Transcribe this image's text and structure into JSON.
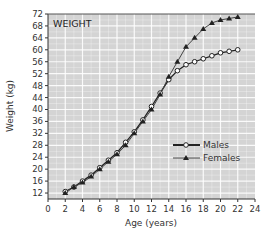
{
  "chart_data": {
    "type": "line",
    "title": "WEIGHT",
    "xlabel": "Age (years)",
    "ylabel": "Weight (kg)",
    "xlim": [
      0,
      24
    ],
    "ylim": [
      10,
      72
    ],
    "xticks": [
      0,
      2,
      4,
      6,
      8,
      10,
      12,
      14,
      16,
      18,
      20,
      22,
      24
    ],
    "yticks": [
      12,
      16,
      20,
      24,
      28,
      32,
      36,
      40,
      44,
      48,
      52,
      56,
      60,
      64,
      68,
      72
    ],
    "grid": true,
    "legend_position": "lower right",
    "x": [
      2,
      3,
      4,
      5,
      6,
      7,
      8,
      9,
      10,
      11,
      12,
      13,
      14,
      15,
      16,
      17,
      18,
      19,
      20,
      21,
      22
    ],
    "series": [
      {
        "name": "Males",
        "marker": "circle-open",
        "values": [
          12.5,
          14,
          16,
          18,
          20.5,
          23,
          25.5,
          29,
          32.5,
          36.5,
          41,
          45.5,
          50,
          53,
          55,
          56,
          57,
          58,
          59,
          59.5,
          60
        ]
      },
      {
        "name": "Females",
        "marker": "triangle-filled",
        "values": [
          12,
          14,
          15.5,
          17.5,
          20,
          22.5,
          25,
          28,
          32,
          36,
          40,
          45,
          51,
          56,
          61,
          64,
          67,
          69,
          70,
          70.5,
          71
        ]
      }
    ]
  }
}
